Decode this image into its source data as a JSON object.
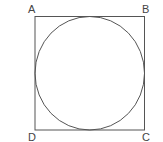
{
  "diagram": {
    "type": "geometry",
    "stroke_color": "#555555",
    "label_color": "#444444",
    "square": {
      "vertices": [
        {
          "label": "A",
          "position": "top-left"
        },
        {
          "label": "B",
          "position": "top-right"
        },
        {
          "label": "C",
          "position": "bottom-right"
        },
        {
          "label": "D",
          "position": "bottom-left"
        }
      ]
    },
    "circle": {
      "inscribed": true
    }
  }
}
